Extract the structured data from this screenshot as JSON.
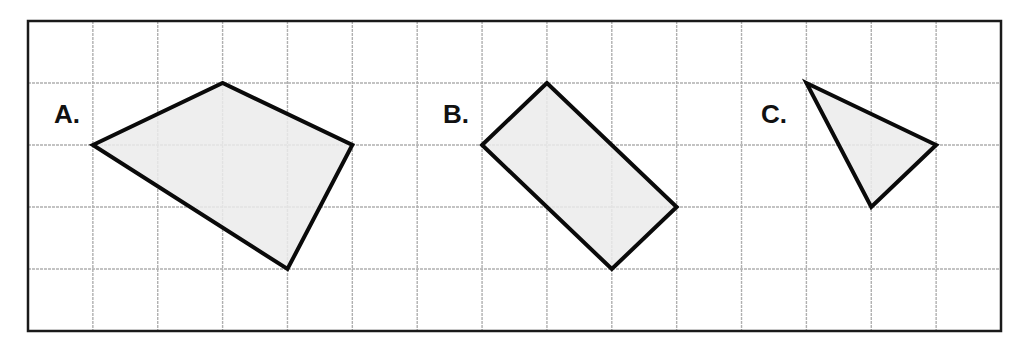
{
  "figure": {
    "frame": {
      "x": 28,
      "y": 21,
      "width": 973,
      "height": 310,
      "stroke": "#1a1a1a",
      "stroke_width": 2.5
    },
    "grid": {
      "columns": 15,
      "rows": 5,
      "line_color": "#b0b0b0",
      "line_dash": "3,1"
    },
    "shape_style": {
      "fill": "#ebebeb",
      "stroke": "#0a0a0a",
      "stroke_width": 4
    },
    "shapes": [
      {
        "label": "A.",
        "label_pos": {
          "x": 54,
          "y": 101
        },
        "grid_vertices": [
          [
            1,
            2
          ],
          [
            3,
            1
          ],
          [
            5,
            2
          ],
          [
            4,
            4
          ]
        ]
      },
      {
        "label": "B.",
        "label_pos": {
          "x": 443,
          "y": 101
        },
        "grid_vertices": [
          [
            8,
            1
          ],
          [
            7,
            2
          ],
          [
            9,
            4
          ],
          [
            10,
            3
          ]
        ]
      },
      {
        "label": "C.",
        "label_pos": {
          "x": 761,
          "y": 101
        },
        "grid_vertices": [
          [
            12,
            1
          ],
          [
            14,
            2
          ],
          [
            13,
            3
          ]
        ]
      }
    ]
  }
}
